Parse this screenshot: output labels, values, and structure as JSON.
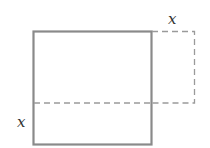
{
  "diagram": {
    "type": "geometry",
    "labels": {
      "top_right": "x",
      "left_bottom": "x"
    },
    "colors": {
      "solid_stroke": "#8a8a8a",
      "dashed_stroke": "#9a9a9a",
      "label": "#333333"
    }
  }
}
